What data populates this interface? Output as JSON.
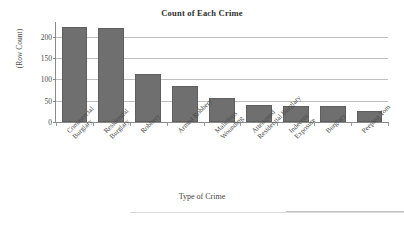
{
  "chart_data": {
    "type": "bar",
    "title": "Count of Each Crime",
    "xlabel": "Type of Crime",
    "ylabel": "(Row Count)",
    "grid": true,
    "legend": "none",
    "ylim": [
      0,
      230
    ],
    "yticks": [
      0,
      50,
      100,
      150,
      200
    ],
    "ytick_labels": [
      "0",
      "50",
      "100",
      "150",
      "200"
    ],
    "categories": [
      "Commercial Burglary",
      "Residential Burglary",
      "Robbery",
      "Armed Robbery",
      "Malicious Wounding",
      "Attempted Residential Burglary",
      "Indecent Exposure",
      "Burglary",
      "Peeping Tom"
    ],
    "category_lines": [
      [
        "Commercial",
        "Burglary"
      ],
      [
        "Residential",
        "Burglary"
      ],
      [
        "Robbery"
      ],
      [
        "Armed Robbery"
      ],
      [
        "Malicious",
        "Wounding"
      ],
      [
        "Attempted",
        "Residential Burglary"
      ],
      [
        "Indecent",
        "Exposure"
      ],
      [
        "Burglary"
      ],
      [
        "Peeping Tom"
      ]
    ],
    "values": [
      224,
      221,
      112,
      84,
      57,
      39,
      37,
      37,
      27
    ],
    "bar_color": "#6f6f6f",
    "bar_edge_color": "#5e5e5e",
    "gridline_color": "#bfbfbf",
    "axis_color": "#8a8a8a",
    "background_color": "#ffffff",
    "text_color": "#3a3a3a"
  }
}
